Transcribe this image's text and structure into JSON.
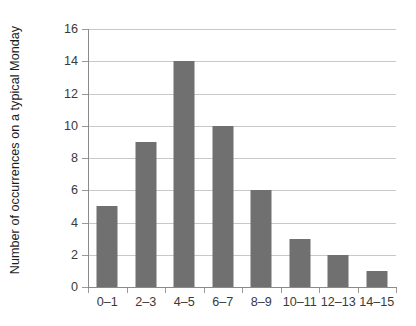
{
  "chart_data": {
    "type": "bar",
    "title": "",
    "subtitle": "",
    "xlabel": "",
    "ylabel": "Number of occurrences on a typical Monday",
    "categories": [
      "0–1",
      "2–3",
      "4–5",
      "6–7",
      "8–9",
      "10–11",
      "12–13",
      "14–15"
    ],
    "values": [
      5,
      9,
      14,
      10,
      6,
      3,
      2,
      1
    ],
    "ylim": [
      0,
      16
    ],
    "y_ticks": [
      0,
      2,
      4,
      6,
      8,
      10,
      12,
      14,
      16
    ],
    "y_tick_labels": [
      "0",
      "2",
      "4",
      "6",
      "8",
      "10",
      "12",
      "14",
      "16"
    ],
    "grid": "horizontal",
    "legend": "none",
    "annotations": [],
    "colors": {
      "bar": "#707070",
      "gridline": "#c8c8c8",
      "axis": "#8a8a8a",
      "tick_text": "#3a3a3a",
      "title_text": "#1d1d1d",
      "background": "#ffffff"
    }
  }
}
